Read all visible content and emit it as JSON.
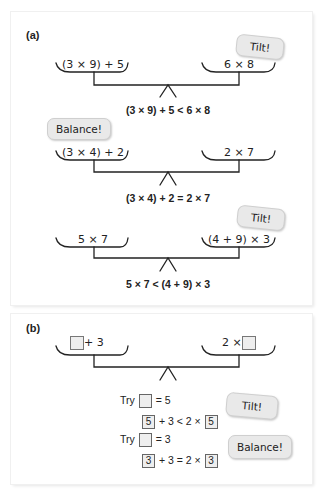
{
  "panel_a": {
    "label": "(a)",
    "scales": [
      {
        "left": "(3 × 9) + 5",
        "right": "6 × 8",
        "equation": "(3 × 9) + 5 < 6 × 8",
        "tag": "Tilt!"
      },
      {
        "left": "(3 × 4) + 2",
        "right": "2 × 7",
        "equation": "(3 × 4) + 2 = 2 × 7",
        "tag": "Balance!"
      },
      {
        "left": "5 × 7",
        "right": "(4 + 9) × 3",
        "equation": "5 × 7 < (4 + 9) × 3",
        "tag": "Tilt!"
      }
    ]
  },
  "panel_b": {
    "label": "(b)",
    "left_suffix": "+ 3",
    "right_prefix": "2 ×",
    "tries": [
      {
        "try_label": "Try",
        "assign": "= 5",
        "value": "5",
        "mid": "+ 3 < 2 ×",
        "tag": "Tilt!"
      },
      {
        "try_label": "Try",
        "assign": "= 3",
        "value": "3",
        "mid": "+ 3 = 2 ×",
        "tag": "Balance!"
      }
    ]
  }
}
